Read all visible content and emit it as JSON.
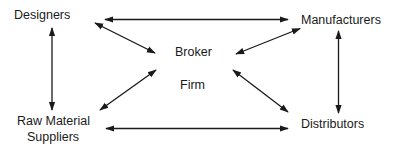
{
  "diagram": {
    "type": "flow-network",
    "nodes": {
      "designers": "Designers",
      "manufacturers": "Manufacturers",
      "broker_line1": "Broker",
      "broker_line2": "Firm",
      "raw_line1": "Raw Material",
      "raw_line2": "Suppliers",
      "distributors": "Distributors"
    },
    "edges": [
      {
        "from": "Designers",
        "to": "Manufacturers",
        "direction": "bidirectional"
      },
      {
        "from": "Designers",
        "to": "Raw Material Suppliers",
        "direction": "bidirectional"
      },
      {
        "from": "Manufacturers",
        "to": "Distributors",
        "direction": "bidirectional"
      },
      {
        "from": "Raw Material Suppliers",
        "to": "Distributors",
        "direction": "bidirectional"
      },
      {
        "from": "Designers",
        "to": "Broker Firm",
        "direction": "bidirectional"
      },
      {
        "from": "Manufacturers",
        "to": "Broker Firm",
        "direction": "bidirectional"
      },
      {
        "from": "Raw Material Suppliers",
        "to": "Broker Firm",
        "direction": "bidirectional"
      },
      {
        "from": "Distributors",
        "to": "Broker Firm",
        "direction": "bidirectional"
      }
    ],
    "colors": {
      "line": "#1a1a1a",
      "background": "#ffffff"
    }
  }
}
